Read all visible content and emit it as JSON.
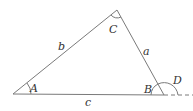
{
  "diagram": {
    "title": "",
    "colors": {
      "line": "#7a7a7a",
      "text": "#333333"
    },
    "vertices": {
      "A": "A",
      "B": "B",
      "C": "C"
    },
    "sides": {
      "a": "a",
      "b": "b",
      "c": "c"
    },
    "exterior_angle": "D"
  }
}
